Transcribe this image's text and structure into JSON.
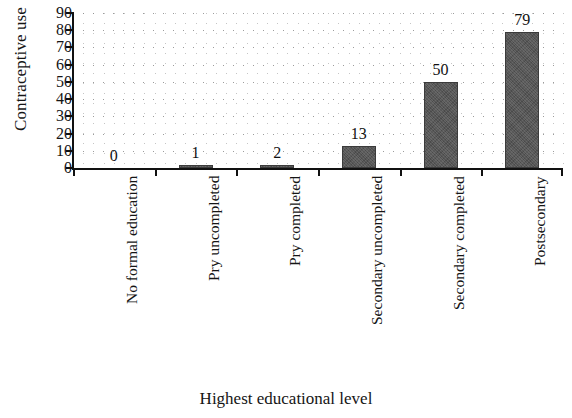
{
  "chart_data": {
    "type": "bar",
    "title": "",
    "xlabel": "Highest educational level",
    "ylabel": "Contraceptive use",
    "categories": [
      "No formal education",
      "Pry uncompleted",
      "Pry completed",
      "Secondary uncompleted",
      "Secondary completed",
      "Postsecondary"
    ],
    "values": [
      0,
      1,
      2,
      13,
      50,
      79
    ],
    "value_labels": [
      "0",
      "1",
      "2",
      "13",
      "50",
      "79"
    ],
    "ylim": [
      0,
      90
    ],
    "yticks": [
      90,
      80,
      70,
      60,
      50,
      40,
      30,
      20,
      10,
      0
    ],
    "ytick_labels": [
      "90",
      "80",
      "70",
      "60",
      "50",
      "40",
      "30",
      "20",
      "10",
      "0"
    ],
    "grid": "dotted",
    "legend": "none",
    "bar_color": "#565656",
    "axis_color": "#111111",
    "grid_color": "#8b8b8b"
  }
}
